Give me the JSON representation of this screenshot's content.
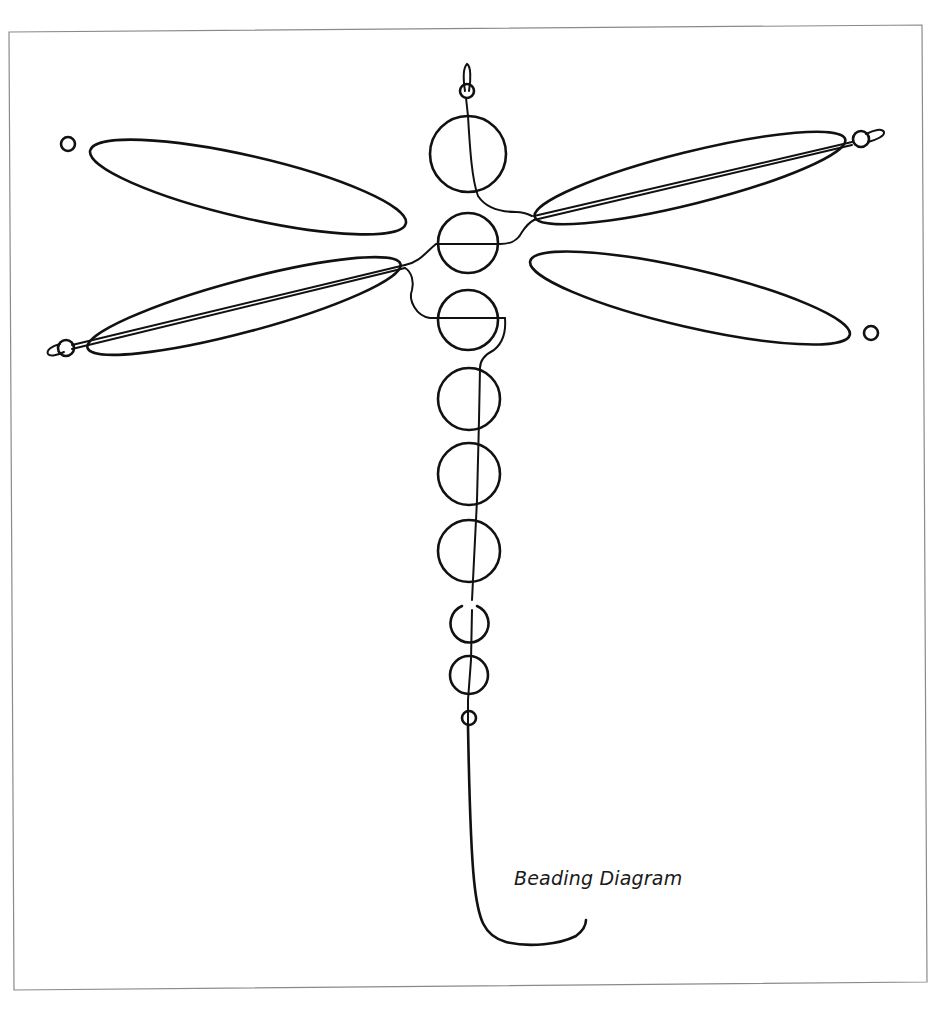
{
  "diagram": {
    "caption": "Beading Diagram",
    "colors": {
      "ink": "#111111",
      "frame": "#8a8a8a",
      "background": "#ffffff"
    },
    "parts": {
      "head_loop": "wire-loop",
      "body_beads_large": 6,
      "body_beads_small": 2,
      "end_beads_small": 2,
      "wings": 4,
      "wing_tip_beads": 4
    }
  }
}
